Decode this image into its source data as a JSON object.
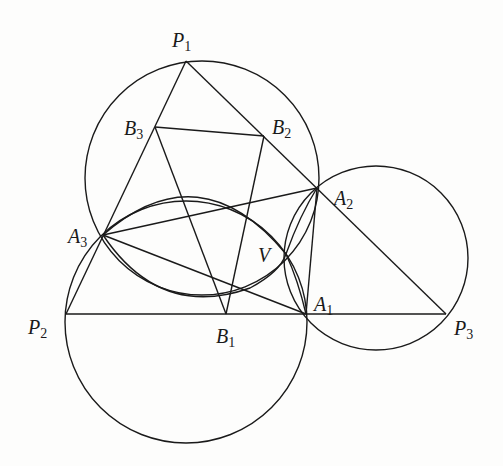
{
  "figure": {
    "type": "geometry-diagram",
    "stroke_color": "#1a1a1a",
    "background": "#fdfdfc"
  },
  "points": {
    "P1": {
      "x": 186,
      "y": 61
    },
    "P2": {
      "x": 66,
      "y": 314
    },
    "P3": {
      "x": 446,
      "y": 314
    },
    "A1": {
      "x": 306,
      "y": 314
    },
    "A2": {
      "x": 317,
      "y": 188
    },
    "A3": {
      "x": 103,
      "y": 235
    },
    "B1": {
      "x": 226,
      "y": 314
    },
    "B2": {
      "x": 264,
      "y": 136
    },
    "B3": {
      "x": 155,
      "y": 127
    },
    "V": {
      "x": 286,
      "y": 254
    }
  },
  "labels": [
    {
      "id": "P1",
      "base": "P",
      "sub": "1",
      "x": 172,
      "y": 30
    },
    {
      "id": "P2",
      "base": "P",
      "sub": "2",
      "x": 28,
      "y": 317
    },
    {
      "id": "P3",
      "base": "P",
      "sub": "3",
      "x": 454,
      "y": 318
    },
    {
      "id": "A1",
      "base": "A",
      "sub": "1",
      "x": 314,
      "y": 294
    },
    {
      "id": "A2",
      "base": "A",
      "sub": "2",
      "x": 334,
      "y": 188
    },
    {
      "id": "A3",
      "base": "A",
      "sub": "3",
      "x": 68,
      "y": 226
    },
    {
      "id": "B1",
      "base": "B",
      "sub": "1",
      "x": 216,
      "y": 326
    },
    {
      "id": "B2",
      "base": "B",
      "sub": "2",
      "x": 272,
      "y": 117
    },
    {
      "id": "B3",
      "base": "B",
      "sub": "3",
      "x": 124,
      "y": 118
    },
    {
      "id": "V",
      "base": "V",
      "sub": "",
      "x": 258,
      "y": 245
    }
  ],
  "segments": [
    [
      "P1",
      "P2"
    ],
    [
      "P1",
      "P3"
    ],
    [
      "P2",
      "P3"
    ],
    [
      "B1",
      "B2"
    ],
    [
      "B2",
      "B3"
    ],
    [
      "B3",
      "B1"
    ],
    [
      "A3",
      "A2"
    ],
    [
      "A3",
      "A1"
    ],
    [
      "A1",
      "A2"
    ]
  ],
  "circles": [
    {
      "name": "circle-P1-A3-A2",
      "cx": 202,
      "cy": 178,
      "r": 117
    },
    {
      "name": "circle-P2-A1-A3",
      "cx": 186,
      "cy": 322,
      "r": 121
    },
    {
      "name": "circle-P3-A1-A2",
      "cx": 376,
      "cy": 258,
      "r": 92
    }
  ],
  "arcs": [
    {
      "name": "arc-A3-V-A1",
      "path": "M103,235 Q200,150 286,254 Q298,280 306,314"
    },
    {
      "name": "arc-A3-V-A2",
      "path": "M103,235 Q160,320 250,288 Q280,272 286,254 Q300,215 317,188"
    }
  ]
}
